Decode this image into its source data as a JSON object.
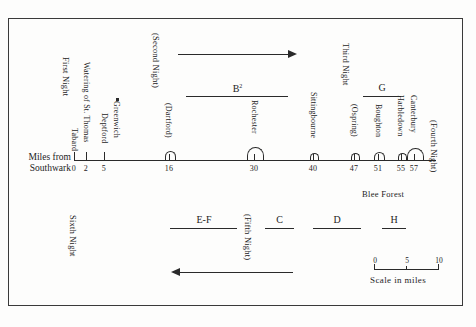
{
  "figure": {
    "type": "route-timeline-diagram",
    "axis_title_line1": "Miles from",
    "axis_title_line2": "Southwark",
    "background_color": "#fdfdfc",
    "ink_color": "#2a2a2a"
  },
  "axis": {
    "ticks": [
      {
        "value": 0,
        "label": "0"
      },
      {
        "value": 2,
        "label": "2"
      },
      {
        "value": 5,
        "label": "5"
      },
      {
        "value": 16,
        "label": "16"
      },
      {
        "value": 30,
        "label": "30"
      },
      {
        "value": 40,
        "label": "40"
      },
      {
        "value": 47,
        "label": "47"
      },
      {
        "value": 51,
        "label": "51"
      },
      {
        "value": 55,
        "label": "55"
      },
      {
        "value": 57,
        "label": "57"
      }
    ],
    "range": [
      0,
      62
    ]
  },
  "places": [
    {
      "name": "Tabard",
      "mile": 0
    },
    {
      "name": "Watering of St. Thomas",
      "mile": 2
    },
    {
      "name": "Deptford",
      "mile": 5
    },
    {
      "name": "Greenwich",
      "mile": 7,
      "marker": "square-marker"
    },
    {
      "name": "(Dartford)",
      "mile": 16
    },
    {
      "name": "Rochester",
      "mile": 30
    },
    {
      "name": "Sittingbourne",
      "mile": 40
    },
    {
      "name": "(Ospring)",
      "mile": 47
    },
    {
      "name": "Boughton",
      "mile": 51
    },
    {
      "name": "Harbledown",
      "mile": 55
    },
    {
      "name": "Canterbury",
      "mile": 57
    }
  ],
  "nights": [
    {
      "label": "First Night",
      "mile": 0
    },
    {
      "label": "(Second Night)",
      "mile": 16
    },
    {
      "label": "Third Night",
      "mile": 47
    },
    {
      "label": "(Fourth Night)",
      "mile": 60
    },
    {
      "label": "(Fifth Night)",
      "mile": 27
    },
    {
      "label": "Sixth Night",
      "mile": 0
    }
  ],
  "outbound_segments": [
    {
      "label": "B",
      "superscript": "2",
      "start_mile": 20,
      "end_mile": 37
    }
  ],
  "third_night_segment": {
    "label": "G",
    "start_mile": 50,
    "end_mile": 56
  },
  "return_segments": [
    {
      "label": "E-F",
      "start_mile": 15,
      "end_mile": 25
    },
    {
      "label": "C",
      "start_mile": 28,
      "end_mile": 35
    },
    {
      "label": "D",
      "start_mile": 38,
      "end_mile": 46
    },
    {
      "label": "H",
      "start_mile": 50,
      "end_mile": 56
    }
  ],
  "arrows": {
    "outbound_direction": "right",
    "return_direction": "left"
  },
  "annotations": {
    "blee_forest": "Blee Forest"
  },
  "scale": {
    "caption": "Scale in miles",
    "ticks": [
      "0",
      "5",
      "10"
    ]
  }
}
